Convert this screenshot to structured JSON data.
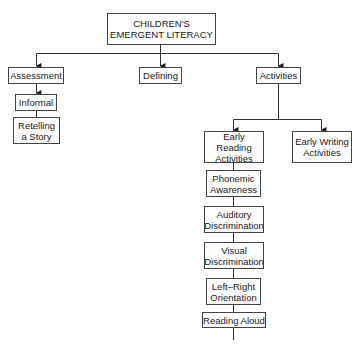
{
  "diagram": {
    "title": "CHILDREN'S\nEMERGENT LITERACY",
    "level1": {
      "assessment": "Assessment",
      "defining": "Defining",
      "activities": "Activities"
    },
    "assessment_children": {
      "informal": "Informal",
      "retelling": "Retelling\na Story"
    },
    "activities_children": {
      "early_reading": "Early Reading\nActivities",
      "early_writing": "Early Writing\nActivities"
    },
    "early_reading_chain": [
      "Phonemic\nAwareness",
      "Auditory\nDiscrimination",
      "Visual\nDiscrimination",
      "Left–Right\nOrientation",
      "Reading Aloud",
      "Comprehension\nSkills"
    ]
  }
}
